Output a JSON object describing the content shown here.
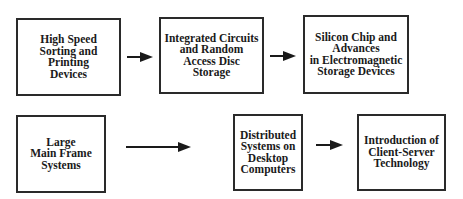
{
  "diagram": {
    "type": "flow",
    "rows": [
      {
        "boxes": [
          {
            "id": "b1",
            "label": "High Speed\nSorting and\nPrinting\nDevices"
          },
          {
            "id": "b2",
            "label": "Integrated Circuits\nand Random\nAccess Disc\nStorage"
          },
          {
            "id": "b3",
            "label": "Silicon Chip and\nAdvances\nin Electromagnetic\nStorage Devices"
          }
        ],
        "arrows": [
          {
            "from": "b1",
            "to": "b2"
          },
          {
            "from": "b2",
            "to": "b3"
          }
        ]
      },
      {
        "boxes": [
          {
            "id": "b4",
            "label": "Large\nMain Frame\nSystems"
          },
          {
            "id": "b5",
            "label": "Distributed\nSystems on\nDesktop\nComputers"
          },
          {
            "id": "b6",
            "label": "Introduction of\nClient-Server\nTechnology"
          }
        ],
        "arrows": [
          {
            "from": "b4",
            "to": "b5"
          },
          {
            "from": "b5",
            "to": "b6"
          }
        ]
      }
    ],
    "colors": {
      "border": "#2a2a2a",
      "text": "#1a1a1a",
      "background": "#ffffff"
    }
  }
}
